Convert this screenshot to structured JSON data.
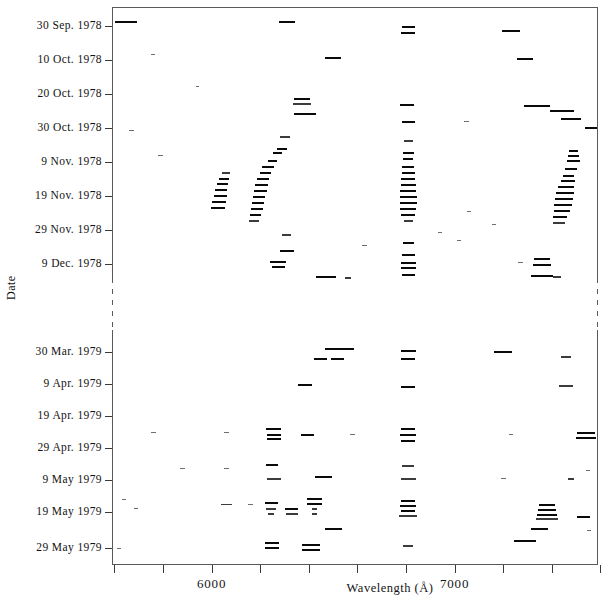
{
  "figure": {
    "x_axis_title": "Wavelength (Å)",
    "y_axis_title": "Date",
    "x_tick_labels": [
      "6000",
      "7000"
    ],
    "y_tick_labels": [
      "30 Sep. 1978",
      "10 Oct. 1978",
      "20 Oct. 1978",
      "30 Oct. 1978",
      "9 Nov. 1978",
      "19 Nov. 1978",
      "29 Nov. 1978",
      "9 Dec. 1978",
      "30 Mar. 1979",
      "9 Apr. 1979",
      "19 Apr. 1979",
      "29 Apr. 1979",
      "9 May 1979",
      "19 May 1979",
      "29 May 1979"
    ]
  },
  "chart_data": {
    "type": "scatter",
    "title": "",
    "xlabel": "Wavelength (Å)",
    "ylabel": "Date",
    "xlim": [
      5590,
      7590
    ],
    "ylim_dates": [
      "1978-09-30",
      "1979-05-29"
    ],
    "axis_break": {
      "present": true,
      "between": [
        "9 Dec. 1978",
        "30 Mar. 1979"
      ],
      "style": "dashed-spine"
    },
    "grid": false,
    "legend": null,
    "x_ticks": [
      5600,
      5800,
      6000,
      6200,
      6400,
      6600,
      6800,
      7000,
      7200,
      7400,
      7600
    ],
    "x_tick_labels_shown": {
      "6000": 6000,
      "7000": 7000
    },
    "y_ticks": [
      "30 Sep. 1978",
      "10 Oct. 1978",
      "20 Oct. 1978",
      "30 Oct. 1978",
      "9 Nov. 1978",
      "19 Nov. 1978",
      "29 Nov. 1978",
      "9 Dec. 1978",
      "30 Mar. 1979",
      "9 Apr. 1979",
      "19 Apr. 1979",
      "29 Apr. 1979",
      "9 May 1979",
      "19 May 1979",
      "29 May 1979"
    ],
    "marker": "horizontal-dash",
    "points": [
      {
        "x": 5648,
        "y": 20.5,
        "w": 22,
        "t": 2,
        "s": "dark"
      },
      {
        "x": 6312,
        "y": 20.5,
        "w": 16,
        "t": 2,
        "s": "dark"
      },
      {
        "x": 6810,
        "y": 26.0,
        "w": 13,
        "t": 2,
        "s": "dark"
      },
      {
        "x": 6810,
        "y": 32.0,
        "w": 14,
        "t": 2,
        "s": "dark"
      },
      {
        "x": 7230,
        "y": 30.0,
        "w": 18,
        "t": 2,
        "s": "dark"
      },
      {
        "x": 5760,
        "y": 54.0,
        "w": 4,
        "t": 1,
        "s": "faint"
      },
      {
        "x": 6500,
        "y": 57.0,
        "w": 16,
        "t": 2,
        "s": "dark"
      },
      {
        "x": 7290,
        "y": 58.0,
        "w": 16,
        "t": 2,
        "s": "dark"
      },
      {
        "x": 5940,
        "y": 86.0,
        "w": 3,
        "t": 1,
        "s": "faint"
      },
      {
        "x": 6370,
        "y": 98.0,
        "w": 16,
        "t": 2,
        "s": "dark"
      },
      {
        "x": 6370,
        "y": 103.0,
        "w": 18,
        "t": 2,
        "s": "mid"
      },
      {
        "x": 6805,
        "y": 104.0,
        "w": 14,
        "t": 2,
        "s": "dark"
      },
      {
        "x": 7340,
        "y": 105.0,
        "w": 26,
        "t": 2,
        "s": "dark"
      },
      {
        "x": 7440,
        "y": 110.0,
        "w": 24,
        "t": 2,
        "s": "dark"
      },
      {
        "x": 6385,
        "y": 113.0,
        "w": 22,
        "t": 2,
        "s": "dark"
      },
      {
        "x": 7480,
        "y": 118.0,
        "w": 20,
        "t": 2,
        "s": "dark"
      },
      {
        "x": 7050,
        "y": 121.0,
        "w": 5,
        "t": 1,
        "s": "faint"
      },
      {
        "x": 6810,
        "y": 121.0,
        "w": 13,
        "t": 2,
        "s": "dark"
      },
      {
        "x": 7560,
        "y": 127.0,
        "w": 12,
        "t": 2,
        "s": "dark"
      },
      {
        "x": 5670,
        "y": 130.0,
        "w": 5,
        "t": 1,
        "s": "faint"
      },
      {
        "x": 6300,
        "y": 136.0,
        "w": 10,
        "t": 2,
        "s": "mid"
      },
      {
        "x": 6810,
        "y": 140.0,
        "w": 9,
        "t": 2,
        "s": "mid"
      },
      {
        "x": 6290,
        "y": 148.0,
        "w": 10,
        "t": 2,
        "s": "dark"
      },
      {
        "x": 6270,
        "y": 152.0,
        "w": 9,
        "t": 2,
        "s": "dark"
      },
      {
        "x": 6810,
        "y": 152.0,
        "w": 11,
        "t": 2,
        "s": "dark"
      },
      {
        "x": 5790,
        "y": 155.0,
        "w": 5,
        "t": 1,
        "s": "faint"
      },
      {
        "x": 7490,
        "y": 150.0,
        "w": 9,
        "t": 2,
        "s": "dark"
      },
      {
        "x": 7490,
        "y": 155.0,
        "w": 11,
        "t": 2,
        "s": "dark"
      },
      {
        "x": 7490,
        "y": 160.0,
        "w": 13,
        "t": 2,
        "s": "dark"
      },
      {
        "x": 6810,
        "y": 158.0,
        "w": 10,
        "t": 2,
        "s": "dark"
      },
      {
        "x": 6250,
        "y": 160.0,
        "w": 9,
        "t": 2,
        "s": "dark"
      },
      {
        "x": 6230,
        "y": 166.0,
        "w": 12,
        "t": 2,
        "s": "dark"
      },
      {
        "x": 6810,
        "y": 166.0,
        "w": 12,
        "t": 2,
        "s": "dark"
      },
      {
        "x": 7480,
        "y": 168.0,
        "w": 12,
        "t": 2,
        "s": "dark"
      },
      {
        "x": 6060,
        "y": 172.0,
        "w": 8,
        "t": 2,
        "s": "mid"
      },
      {
        "x": 6220,
        "y": 172.0,
        "w": 11,
        "t": 2,
        "s": "dark"
      },
      {
        "x": 6810,
        "y": 172.0,
        "w": 13,
        "t": 2,
        "s": "dark"
      },
      {
        "x": 7470,
        "y": 175.0,
        "w": 11,
        "t": 2,
        "s": "dark"
      },
      {
        "x": 6050,
        "y": 178.0,
        "w": 10,
        "t": 2,
        "s": "dark"
      },
      {
        "x": 6210,
        "y": 178.0,
        "w": 12,
        "t": 2,
        "s": "dark"
      },
      {
        "x": 6810,
        "y": 178.0,
        "w": 14,
        "t": 2,
        "s": "dark"
      },
      {
        "x": 7465,
        "y": 180.0,
        "w": 14,
        "t": 2,
        "s": "dark"
      },
      {
        "x": 6045,
        "y": 183.0,
        "w": 11,
        "t": 2,
        "s": "dark"
      },
      {
        "x": 6205,
        "y": 184.0,
        "w": 13,
        "t": 2,
        "s": "dark"
      },
      {
        "x": 6810,
        "y": 184.0,
        "w": 15,
        "t": 2,
        "s": "dark"
      },
      {
        "x": 7460,
        "y": 186.0,
        "w": 16,
        "t": 2,
        "s": "dark"
      },
      {
        "x": 6040,
        "y": 189.0,
        "w": 12,
        "t": 2,
        "s": "dark"
      },
      {
        "x": 6200,
        "y": 190.0,
        "w": 13,
        "t": 2,
        "s": "dark"
      },
      {
        "x": 6810,
        "y": 190.0,
        "w": 16,
        "t": 2,
        "s": "dark"
      },
      {
        "x": 7455,
        "y": 192.0,
        "w": 18,
        "t": 2,
        "s": "dark"
      },
      {
        "x": 6035,
        "y": 195.0,
        "w": 13,
        "t": 2,
        "s": "dark"
      },
      {
        "x": 6195,
        "y": 196.0,
        "w": 12,
        "t": 2,
        "s": "dark"
      },
      {
        "x": 6810,
        "y": 196.0,
        "w": 17,
        "t": 2,
        "s": "dark"
      },
      {
        "x": 7450,
        "y": 198.0,
        "w": 18,
        "t": 2,
        "s": "dark"
      },
      {
        "x": 6030,
        "y": 201.0,
        "w": 14,
        "t": 2,
        "s": "dark"
      },
      {
        "x": 6190,
        "y": 202.0,
        "w": 12,
        "t": 2,
        "s": "dark"
      },
      {
        "x": 6810,
        "y": 202.0,
        "w": 17,
        "t": 2,
        "s": "dark"
      },
      {
        "x": 7445,
        "y": 204.0,
        "w": 18,
        "t": 2,
        "s": "dark"
      },
      {
        "x": 6025,
        "y": 207.0,
        "w": 14,
        "t": 2,
        "s": "dark"
      },
      {
        "x": 6185,
        "y": 208.0,
        "w": 12,
        "t": 2,
        "s": "dark"
      },
      {
        "x": 6810,
        "y": 208.0,
        "w": 16,
        "t": 2,
        "s": "dark"
      },
      {
        "x": 7440,
        "y": 210.0,
        "w": 16,
        "t": 2,
        "s": "dark"
      },
      {
        "x": 6180,
        "y": 214.0,
        "w": 11,
        "t": 2,
        "s": "dark"
      },
      {
        "x": 6810,
        "y": 214.0,
        "w": 14,
        "t": 2,
        "s": "dark"
      },
      {
        "x": 7435,
        "y": 216.0,
        "w": 14,
        "t": 2,
        "s": "dark"
      },
      {
        "x": 6175,
        "y": 220.0,
        "w": 10,
        "t": 2,
        "s": "mid"
      },
      {
        "x": 6810,
        "y": 220.0,
        "w": 9,
        "t": 2,
        "s": "mid"
      },
      {
        "x": 7430,
        "y": 222.0,
        "w": 12,
        "t": 2,
        "s": "mid"
      },
      {
        "x": 7060,
        "y": 211.0,
        "w": 4,
        "t": 1,
        "s": "faint"
      },
      {
        "x": 7160,
        "y": 224.0,
        "w": 4,
        "t": 1,
        "s": "faint"
      },
      {
        "x": 6940,
        "y": 232.0,
        "w": 4,
        "t": 1,
        "s": "faint"
      },
      {
        "x": 6310,
        "y": 234.0,
        "w": 9,
        "t": 2,
        "s": "mid"
      },
      {
        "x": 6810,
        "y": 242.0,
        "w": 11,
        "t": 2,
        "s": "dark"
      },
      {
        "x": 7020,
        "y": 240.0,
        "w": 4,
        "t": 1,
        "s": "faint"
      },
      {
        "x": 6630,
        "y": 245.0,
        "w": 5,
        "t": 1,
        "s": "faint"
      },
      {
        "x": 6310,
        "y": 250.0,
        "w": 14,
        "t": 2,
        "s": "dark"
      },
      {
        "x": 6810,
        "y": 254.0,
        "w": 13,
        "t": 2,
        "s": "dark"
      },
      {
        "x": 6275,
        "y": 261.0,
        "w": 16,
        "t": 2,
        "s": "dark"
      },
      {
        "x": 6275,
        "y": 266.0,
        "w": 13,
        "t": 2,
        "s": "dark"
      },
      {
        "x": 6810,
        "y": 262.0,
        "w": 15,
        "t": 2,
        "s": "dark"
      },
      {
        "x": 6810,
        "y": 267.0,
        "w": 15,
        "t": 2,
        "s": "dark"
      },
      {
        "x": 7360,
        "y": 258.0,
        "w": 16,
        "t": 2,
        "s": "dark"
      },
      {
        "x": 7360,
        "y": 264.0,
        "w": 18,
        "t": 2,
        "s": "dark"
      },
      {
        "x": 7270,
        "y": 262.0,
        "w": 5,
        "t": 1,
        "s": "faint"
      },
      {
        "x": 6810,
        "y": 274.0,
        "w": 13,
        "t": 2,
        "s": "dark"
      },
      {
        "x": 6470,
        "y": 276.0,
        "w": 20,
        "t": 2,
        "s": "dark"
      },
      {
        "x": 6560,
        "y": 277.0,
        "w": 6,
        "t": 2,
        "s": "mid"
      },
      {
        "x": 7360,
        "y": 275.0,
        "w": 22,
        "t": 2,
        "s": "dark"
      },
      {
        "x": 7420,
        "y": 276.0,
        "w": 8,
        "t": 2,
        "s": "mid"
      },
      {
        "x": 6500,
        "y": 348.0,
        "w": 16,
        "t": 2,
        "s": "dark"
      },
      {
        "x": 6560,
        "y": 348.0,
        "w": 13,
        "t": 2,
        "s": "dark"
      },
      {
        "x": 6810,
        "y": 350.0,
        "w": 15,
        "t": 2,
        "s": "dark"
      },
      {
        "x": 7200,
        "y": 351.0,
        "w": 18,
        "t": 2,
        "s": "dark"
      },
      {
        "x": 6450,
        "y": 358.0,
        "w": 13,
        "t": 2,
        "s": "dark"
      },
      {
        "x": 6520,
        "y": 358.0,
        "w": 13,
        "t": 2,
        "s": "dark"
      },
      {
        "x": 6810,
        "y": 358.0,
        "w": 14,
        "t": 2,
        "s": "dark"
      },
      {
        "x": 7460,
        "y": 356.0,
        "w": 10,
        "t": 2,
        "s": "mid"
      },
      {
        "x": 6385,
        "y": 384.0,
        "w": 14,
        "t": 2,
        "s": "dark"
      },
      {
        "x": 6810,
        "y": 386.0,
        "w": 14,
        "t": 2,
        "s": "dark"
      },
      {
        "x": 7460,
        "y": 385.0,
        "w": 14,
        "t": 2,
        "s": "mid"
      },
      {
        "x": 5760,
        "y": 432.0,
        "w": 5,
        "t": 1,
        "s": "faint"
      },
      {
        "x": 6060,
        "y": 432.0,
        "w": 5,
        "t": 1,
        "s": "faint"
      },
      {
        "x": 6255,
        "y": 428.0,
        "w": 15,
        "t": 2,
        "s": "dark"
      },
      {
        "x": 6255,
        "y": 434.0,
        "w": 14,
        "t": 2,
        "s": "dark"
      },
      {
        "x": 6255,
        "y": 438.0,
        "w": 14,
        "t": 2,
        "s": "dark"
      },
      {
        "x": 6395,
        "y": 434.0,
        "w": 13,
        "t": 2,
        "s": "dark"
      },
      {
        "x": 6810,
        "y": 428.0,
        "w": 14,
        "t": 2,
        "s": "dark"
      },
      {
        "x": 6810,
        "y": 434.0,
        "w": 16,
        "t": 2,
        "s": "dark"
      },
      {
        "x": 6810,
        "y": 440.0,
        "w": 14,
        "t": 2,
        "s": "dark"
      },
      {
        "x": 6580,
        "y": 434.0,
        "w": 5,
        "t": 1,
        "s": "faint"
      },
      {
        "x": 7540,
        "y": 432.0,
        "w": 18,
        "t": 2,
        "s": "dark"
      },
      {
        "x": 7540,
        "y": 437.0,
        "w": 20,
        "t": 2,
        "s": "dark"
      },
      {
        "x": 7230,
        "y": 434.0,
        "w": 4,
        "t": 1,
        "s": "faint"
      },
      {
        "x": 5880,
        "y": 468.0,
        "w": 5,
        "t": 1,
        "s": "faint"
      },
      {
        "x": 6060,
        "y": 468.0,
        "w": 5,
        "t": 1,
        "s": "faint"
      },
      {
        "x": 6250,
        "y": 464.0,
        "w": 12,
        "t": 2,
        "s": "dark"
      },
      {
        "x": 6810,
        "y": 465.0,
        "w": 12,
        "t": 2,
        "s": "mid"
      },
      {
        "x": 6255,
        "y": 478.0,
        "w": 14,
        "t": 2,
        "s": "mid"
      },
      {
        "x": 6460,
        "y": 476.0,
        "w": 17,
        "t": 2,
        "s": "dark"
      },
      {
        "x": 6810,
        "y": 478.0,
        "w": 15,
        "t": 2,
        "s": "mid"
      },
      {
        "x": 7200,
        "y": 478.0,
        "w": 5,
        "t": 1,
        "s": "faint"
      },
      {
        "x": 7480,
        "y": 478.0,
        "w": 6,
        "t": 2,
        "s": "mid"
      },
      {
        "x": 7550,
        "y": 470.0,
        "w": 4,
        "t": 1,
        "s": "faint"
      },
      {
        "x": 5640,
        "y": 499.0,
        "w": 4,
        "t": 1,
        "s": "faint"
      },
      {
        "x": 5690,
        "y": 508.0,
        "w": 4,
        "t": 1,
        "s": "faint"
      },
      {
        "x": 6060,
        "y": 504.0,
        "w": 11,
        "t": 1,
        "s": "mid"
      },
      {
        "x": 6160,
        "y": 504.0,
        "w": 5,
        "t": 1,
        "s": "faint"
      },
      {
        "x": 6245,
        "y": 502.0,
        "w": 13,
        "t": 2,
        "s": "dark"
      },
      {
        "x": 6245,
        "y": 508.0,
        "w": 10,
        "t": 2,
        "s": "mid"
      },
      {
        "x": 6245,
        "y": 513.0,
        "w": 6,
        "t": 2,
        "s": "mid"
      },
      {
        "x": 6330,
        "y": 508.0,
        "w": 13,
        "t": 2,
        "s": "dark"
      },
      {
        "x": 6330,
        "y": 513.0,
        "w": 12,
        "t": 2,
        "s": "mid"
      },
      {
        "x": 6425,
        "y": 498.0,
        "w": 15,
        "t": 2,
        "s": "dark"
      },
      {
        "x": 6425,
        "y": 503.0,
        "w": 15,
        "t": 2,
        "s": "dark"
      },
      {
        "x": 6425,
        "y": 508.0,
        "w": 5,
        "t": 2,
        "s": "mid"
      },
      {
        "x": 6425,
        "y": 513.0,
        "w": 5,
        "t": 2,
        "s": "mid"
      },
      {
        "x": 6810,
        "y": 500.0,
        "w": 14,
        "t": 2,
        "s": "dark"
      },
      {
        "x": 6810,
        "y": 505.0,
        "w": 16,
        "t": 2,
        "s": "dark"
      },
      {
        "x": 6810,
        "y": 510.0,
        "w": 14,
        "t": 2,
        "s": "dark"
      },
      {
        "x": 6810,
        "y": 515.0,
        "w": 18,
        "t": 2,
        "s": "mid"
      },
      {
        "x": 7380,
        "y": 504.0,
        "w": 16,
        "t": 2,
        "s": "dark"
      },
      {
        "x": 7380,
        "y": 509.0,
        "w": 18,
        "t": 2,
        "s": "dark"
      },
      {
        "x": 7380,
        "y": 514.0,
        "w": 20,
        "t": 2,
        "s": "dark"
      },
      {
        "x": 7380,
        "y": 518.0,
        "w": 22,
        "t": 2,
        "s": "mid"
      },
      {
        "x": 7530,
        "y": 516.0,
        "w": 13,
        "t": 2,
        "s": "dark"
      },
      {
        "x": 6500,
        "y": 528.0,
        "w": 17,
        "t": 2,
        "s": "dark"
      },
      {
        "x": 7350,
        "y": 528.0,
        "w": 17,
        "t": 2,
        "s": "dark"
      },
      {
        "x": 7555,
        "y": 530.0,
        "w": 4,
        "t": 1,
        "s": "faint"
      },
      {
        "x": 6250,
        "y": 542.0,
        "w": 14,
        "t": 2,
        "s": "dark"
      },
      {
        "x": 6250,
        "y": 547.0,
        "w": 14,
        "t": 2,
        "s": "dark"
      },
      {
        "x": 6410,
        "y": 544.0,
        "w": 18,
        "t": 2,
        "s": "dark"
      },
      {
        "x": 6410,
        "y": 549.0,
        "w": 18,
        "t": 2,
        "s": "dark"
      },
      {
        "x": 6810,
        "y": 545.0,
        "w": 10,
        "t": 2,
        "s": "mid"
      },
      {
        "x": 7290,
        "y": 540.0,
        "w": 22,
        "t": 2,
        "s": "dark"
      },
      {
        "x": 5620,
        "y": 548.0,
        "w": 4,
        "t": 1,
        "s": "faint"
      }
    ]
  }
}
